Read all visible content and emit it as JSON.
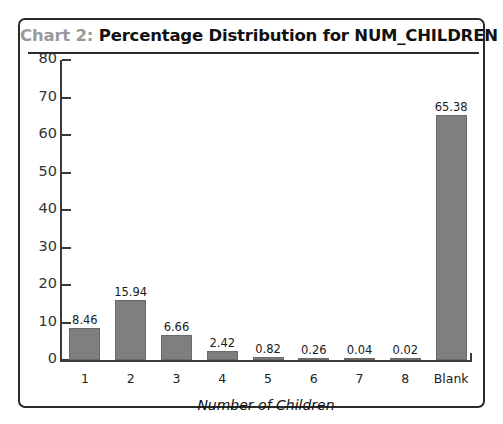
{
  "frame": {
    "border_color": "#2b2b2b",
    "background": "#ffffff"
  },
  "title": {
    "prefix": "Chart 2:",
    "main": " Percentage Distribution for NUM_CHILDREN",
    "full": "Chart 2: Percentage Distribution for NUM_CHILDREN",
    "prefix_color": "#9a9a9a",
    "main_color": "#111111"
  },
  "axis_title": {
    "x": "Number of Children",
    "y": ""
  },
  "y_ticks": [
    "0",
    "10",
    "20",
    "30",
    "40",
    "50",
    "60",
    "70",
    "80"
  ],
  "chart_data": {
    "type": "bar",
    "title": "Chart 2: Percentage Distribution for NUM_CHILDREN",
    "xlabel": "Number of Children",
    "ylabel": "",
    "categories": [
      "1",
      "2",
      "3",
      "4",
      "5",
      "6",
      "7",
      "8",
      "Blank"
    ],
    "values": [
      8.46,
      15.94,
      6.66,
      2.42,
      0.82,
      0.26,
      0.04,
      0.02,
      65.38
    ],
    "labels": [
      "8.46",
      "15.94",
      "6.66",
      "2.42",
      "0.82",
      "0.26",
      "0.04",
      "0.02",
      "65.38"
    ],
    "ylim": [
      0,
      80
    ],
    "ytick_step": 10,
    "grid": false,
    "legend": false,
    "bar_color": "#7f7f7f",
    "bar_border_color": "#6a6a6a"
  }
}
